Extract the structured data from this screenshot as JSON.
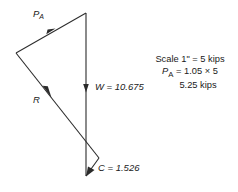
{
  "figure": {
    "type": "force-polygon-diagram",
    "labels": {
      "pa": "P",
      "pa_sub": "A",
      "r": "R",
      "w": "W = 10.675",
      "c": "C = 1.526"
    },
    "scale_note": {
      "line1": "Scale 1\" = 5 kips",
      "line2_name": "P",
      "line2_sub": "A",
      "line2_rest": "= 1.05 × 5",
      "line3": "5.25 kips"
    },
    "colors": {
      "line": "#2b2b2b",
      "text": "#1a1a1a",
      "background": "#ffffff"
    },
    "vectors": [
      {
        "name": "P_A",
        "magnitude": 5.25,
        "unit": "kips",
        "from": [
          16,
          53
        ],
        "to": [
          86,
          13
        ]
      },
      {
        "name": "W",
        "magnitude": 10.675,
        "unit": "kips",
        "from": [
          86,
          13
        ],
        "to": [
          86,
          176
        ]
      },
      {
        "name": "R",
        "magnitude": null,
        "unit": "kips",
        "from": [
          16,
          53
        ],
        "to": [
          99,
          158
        ]
      },
      {
        "name": "C",
        "magnitude": 1.526,
        "unit": "kips",
        "from": [
          99,
          158
        ],
        "to": [
          86,
          176
        ]
      }
    ]
  }
}
